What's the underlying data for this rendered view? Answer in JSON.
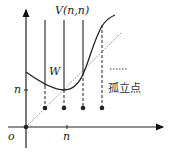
{
  "diagram": {
    "labels": {
      "vertex_label": "V(n,n)",
      "region_label": "W",
      "y_tick": "n",
      "x_tick": "n",
      "origin": "o",
      "legend_text": "孤立点",
      "legend_symbol": "······"
    },
    "colors": {
      "stroke": "#222222",
      "dotted": "#888888"
    }
  }
}
